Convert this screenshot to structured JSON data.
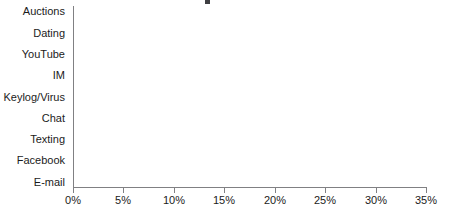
{
  "chart_data": {
    "type": "bar",
    "orientation": "horizontal",
    "title": "",
    "xlabel": "",
    "ylabel": "",
    "xlim": [
      0,
      35
    ],
    "xtick_labels": [
      "0%",
      "5%",
      "10%",
      "15%",
      "20%",
      "25%",
      "30%",
      "35%"
    ],
    "xtick_values": [
      0,
      5,
      10,
      15,
      20,
      25,
      30,
      35
    ],
    "grid": false,
    "legend": false,
    "axis_color": "#808083",
    "bar_fill": "#9b9ba1",
    "bar_edge": "#6d6d72",
    "note": "Bars listed top-to-bottom; category labels shown only on alternating (every other) bars.",
    "categories": [
      "Auctions",
      "",
      "Dating",
      "",
      "YouTube",
      "",
      "IM",
      "",
      "Keylog/Virus",
      "",
      "Chat",
      "",
      "Texting",
      "",
      "Facebook",
      "",
      "E-mail"
    ],
    "bars": [
      {
        "label": "Auctions",
        "value": 1.2,
        "labeled": true
      },
      {
        "label": "",
        "value": 1.7,
        "labeled": false
      },
      {
        "label": "Dating",
        "value": 1.7,
        "labeled": true
      },
      {
        "label": "",
        "value": 1.7,
        "labeled": false
      },
      {
        "label": "YouTube",
        "value": 1.5,
        "labeled": true
      },
      {
        "label": "",
        "value": 2.3,
        "labeled": false
      },
      {
        "label": "IM",
        "value": 2.5,
        "labeled": true
      },
      {
        "label": "",
        "value": 2.8,
        "labeled": false
      },
      {
        "label": "Keylog/Virus",
        "value": 3.5,
        "labeled": true
      },
      {
        "label": "",
        "value": 3.6,
        "labeled": false
      },
      {
        "label": "Chat",
        "value": 3.8,
        "labeled": true
      },
      {
        "label": "",
        "value": 4.0,
        "labeled": false
      },
      {
        "label": "Texting",
        "value": 7.2,
        "labeled": true
      },
      {
        "label": "",
        "value": 10.6,
        "labeled": false
      },
      {
        "label": "Facebook",
        "value": 16.3,
        "labeled": true
      },
      {
        "label": "",
        "value": 21.5,
        "labeled": false
      },
      {
        "label": "E-mail",
        "value": 31.5,
        "labeled": true
      }
    ],
    "labeled_categories": [
      "Auctions",
      "Dating",
      "YouTube",
      "IM",
      "Keylog/Virus",
      "Chat",
      "Texting",
      "Facebook",
      "E-mail"
    ],
    "labeled_values": [
      1.2,
      1.7,
      1.5,
      2.5,
      3.5,
      3.8,
      7.2,
      16.3,
      31.5
    ]
  },
  "layout": {
    "plot_left_px": 73,
    "plot_right_px": 426,
    "plot_top_px": 6,
    "plot_bottom_px": 187
  }
}
